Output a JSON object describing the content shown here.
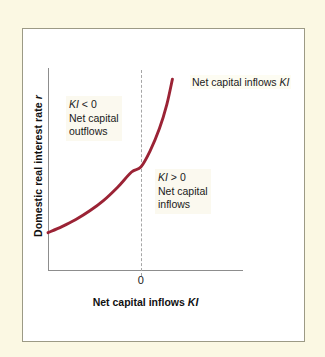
{
  "figure": {
    "background_color": "#fbf8e3",
    "panel_color": "#ffffff",
    "panel_border_color": "#9c9a85",
    "curve_color": "#9b2335",
    "axis_color": "#8d8d8d",
    "dashed_line_color": "#a6a6a6"
  },
  "chart_data": {
    "type": "line",
    "title": "",
    "subtitle": "",
    "xlabel_prefix": "Net capital inflows ",
    "xlabel_symbol": "KI",
    "ylabel_prefix": "Domestic real interest rate ",
    "ylabel_symbol": "r",
    "xlim": [
      -1,
      1.1
    ],
    "ylim": [
      0,
      1
    ],
    "grid": false,
    "legend_position": "none",
    "x_tick_labels": [
      "0"
    ],
    "x_tick_values": [
      0
    ],
    "y_tick_labels": [],
    "series": [
      {
        "name": "Net capital inflows KI",
        "color": "#9b2335",
        "x": [
          -1.0,
          -0.85,
          -0.7,
          -0.55,
          -0.4,
          -0.25,
          -0.1,
          0.0,
          0.1,
          0.2,
          0.28,
          0.34
        ],
        "y": [
          0.185,
          0.215,
          0.25,
          0.293,
          0.345,
          0.41,
          0.485,
          0.51,
          0.59,
          0.7,
          0.82,
          0.945
        ]
      }
    ],
    "reference_lines": [
      {
        "name": "zero-vertical",
        "orientation": "vertical",
        "value": 0,
        "style": "dashed",
        "color": "#a6a6a6"
      }
    ],
    "annotations": [
      {
        "id": "outflows",
        "symbol": "KI",
        "condition": " < 0",
        "line2": "Net capital",
        "line3": "outflows",
        "quadrant": "upper-left"
      },
      {
        "id": "inflows",
        "symbol": "KI",
        "condition": " > 0",
        "line2": "Net capital",
        "line3": "inflows",
        "quadrant": "lower-right"
      }
    ],
    "curve_label": {
      "prefix": "Net capital inflows ",
      "symbol": "KI"
    }
  },
  "labels": {
    "y_axis_text": "Domestic real interest rate ",
    "y_axis_italic": "r",
    "x_axis_text": "Net capital inflows ",
    "x_axis_italic": "KI",
    "zero_tick": "0",
    "curve_label_text": "Net capital inflows ",
    "curve_label_italic": "KI",
    "annotation_outflows": {
      "italic_symbol": "KI",
      "comparison": " < 0",
      "line2": "Net capital",
      "line3": "outflows"
    },
    "annotation_inflows": {
      "italic_symbol": "KI",
      "comparison": " > 0",
      "line2": "Net capital",
      "line3": "inflows"
    }
  }
}
